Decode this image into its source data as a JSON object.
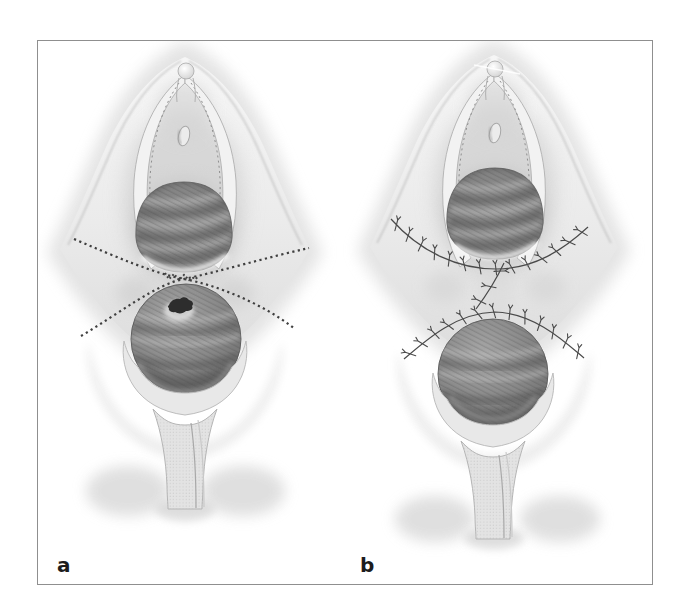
{
  "figure": {
    "panels": [
      {
        "label": "a"
      },
      {
        "label": "b"
      }
    ]
  },
  "colors": {
    "background": "#ffffff",
    "frame_border": "#8f8f8f",
    "skin_light": "#f5f5f5",
    "skin_mid": "#e3e3e3",
    "skin_shadow": "#c9c9c9",
    "opening_gray": "#828282",
    "mass_gray": "#757575",
    "lesion_dark": "#2d2d2d",
    "incision_dotted": "#3f3f3f",
    "suture_gray": "#4a4a4a",
    "label_text": "#1c1c1c"
  }
}
